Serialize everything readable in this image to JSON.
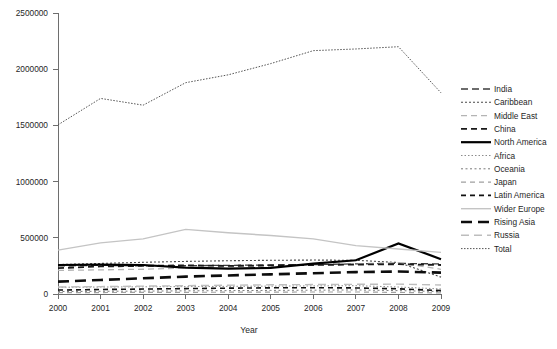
{
  "chart_data": {
    "type": "line",
    "title": "",
    "xlabel": "Year",
    "ylabel": "",
    "categories": [
      2000,
      2001,
      2002,
      2003,
      2004,
      2005,
      2006,
      2007,
      2008,
      2009
    ],
    "x": [
      "2000",
      "2001",
      "2002",
      "2003",
      "2004",
      "2005",
      "2006",
      "2007",
      "2008",
      "2009"
    ],
    "xlim": [
      2000,
      2009
    ],
    "ylim": [
      0,
      2500000
    ],
    "yticks": [
      0,
      500000,
      1000000,
      1500000,
      2000000,
      2500000
    ],
    "ytick_labels": [
      "0",
      "500000",
      "1000000",
      "1500000",
      "2000000",
      "2500000"
    ],
    "grid": false,
    "legend_position": "right",
    "series": [
      {
        "name": "India",
        "values": [
          250000,
          255000,
          250000,
          252000,
          255000,
          258000,
          262000,
          268000,
          272000,
          268000
        ],
        "color": "#3c3c3c",
        "width": 1.3,
        "dash": "7,4"
      },
      {
        "name": "Caribbean",
        "values": [
          262000,
          272000,
          282000,
          290000,
          296000,
          300000,
          302000,
          300000,
          280000,
          150000
        ],
        "color": "#4a4a4a",
        "width": 1.1,
        "dash": "2,2"
      },
      {
        "name": "Middle East",
        "values": [
          210000,
          215000,
          220000,
          232000,
          242000,
          250000,
          258000,
          268000,
          280000,
          220000
        ],
        "color": "#b4b4b4",
        "width": 1.3,
        "dash": "6,4"
      },
      {
        "name": "China",
        "values": [
          230000,
          245000,
          250000,
          255000,
          250000,
          255000,
          258000,
          262000,
          265000,
          258000
        ],
        "color": "#1a1a1a",
        "width": 1.8,
        "dash": "6,4"
      },
      {
        "name": "North America",
        "values": [
          258000,
          262000,
          258000,
          235000,
          225000,
          232000,
          270000,
          300000,
          450000,
          310000
        ],
        "color": "#000000",
        "width": 2.2,
        "dash": "none"
      },
      {
        "name": "Africa",
        "values": [
          60000,
          62000,
          64000,
          66000,
          68000,
          70000,
          72000,
          74000,
          62000,
          45000
        ],
        "color": "#8c8c8c",
        "width": 1.0,
        "dash": "1.5,2"
      },
      {
        "name": "Oceania",
        "values": [
          22000,
          24000,
          26000,
          28000,
          30000,
          32000,
          34000,
          36000,
          30000,
          22000
        ],
        "color": "#7a7a7a",
        "width": 1.0,
        "dash": "2,2.5"
      },
      {
        "name": "Japan",
        "values": [
          12000,
          13000,
          14000,
          15000,
          16000,
          17000,
          18000,
          18000,
          14000,
          10000
        ],
        "color": "#a0a0a0",
        "width": 1.2,
        "dash": "5,4"
      },
      {
        "name": "Latin America",
        "values": [
          35000,
          40000,
          44000,
          48000,
          52000,
          55000,
          56000,
          54000,
          46000,
          30000
        ],
        "color": "#111111",
        "width": 1.6,
        "dash": "5,4"
      },
      {
        "name": "Wider Europe",
        "values": [
          390000,
          455000,
          490000,
          575000,
          545000,
          520000,
          490000,
          430000,
          400000,
          370000
        ],
        "color": "#c4c4c4",
        "width": 1.4,
        "dash": "none"
      },
      {
        "name": "Rising Asia",
        "values": [
          110000,
          125000,
          140000,
          155000,
          165000,
          175000,
          185000,
          195000,
          200000,
          190000
        ],
        "color": "#0d0d0d",
        "width": 2.6,
        "dash": "11,6"
      },
      {
        "name": "Russia",
        "values": [
          62000,
          66000,
          70000,
          74000,
          78000,
          82000,
          84000,
          86000,
          88000,
          80000
        ],
        "color": "#bdbdbd",
        "width": 1.4,
        "dash": "8,5"
      },
      {
        "name": "Total",
        "values": [
          1505000,
          1740000,
          1680000,
          1880000,
          1950000,
          2050000,
          2165000,
          2180000,
          2200000,
          1790000
        ],
        "color": "#545454",
        "width": 1.0,
        "dash": "1.5,1.5"
      }
    ]
  },
  "legend": {
    "entries": [
      {
        "label": "India"
      },
      {
        "label": "Caribbean"
      },
      {
        "label": "Middle East"
      },
      {
        "label": "China"
      },
      {
        "label": "North America"
      },
      {
        "label": "Africa"
      },
      {
        "label": "Oceania"
      },
      {
        "label": "Japan"
      },
      {
        "label": "Latin America"
      },
      {
        "label": "Wider Europe"
      },
      {
        "label": "Rising Asia"
      },
      {
        "label": "Russia"
      },
      {
        "label": "Total"
      }
    ]
  }
}
